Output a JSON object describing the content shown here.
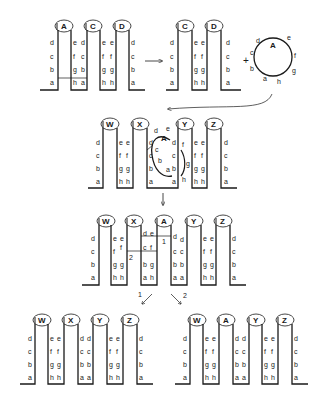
{
  "figure": {
    "colors": {
      "ink": "#1a1a1a",
      "background": "#ffffff"
    },
    "row1_left": {
      "hairpins": [
        {
          "name": "A",
          "left": [
            "d",
            "c",
            "b",
            "a"
          ],
          "right": [
            "e",
            "f",
            "g",
            "h"
          ]
        },
        {
          "name": "C",
          "left": [
            "d",
            "c",
            "b",
            "a"
          ],
          "right": [
            "e",
            "f",
            "g",
            "h"
          ]
        },
        {
          "name": "D",
          "left": [
            "d",
            "c",
            "b",
            "a"
          ],
          "right": [
            "d",
            "c",
            "b",
            "a"
          ]
        }
      ]
    },
    "row1_right": {
      "hairpins": [
        {
          "name": "C",
          "left": [
            "d",
            "c",
            "b",
            "a"
          ],
          "right": [
            "e",
            "f",
            "g",
            "h"
          ]
        },
        {
          "name": "D",
          "left": [
            "e",
            "f",
            "g",
            "h"
          ],
          "right": [
            "d",
            "c",
            "b",
            "a"
          ]
        }
      ],
      "plus": "+",
      "circle": {
        "name": "A",
        "letters": [
          "d",
          "e",
          "f",
          "g",
          "h",
          "a",
          "b",
          "c"
        ]
      }
    },
    "row2": {
      "hairpins": [
        {
          "name": "W",
          "left": [
            "d",
            "c",
            "b",
            "a"
          ],
          "right": [
            "e",
            "f",
            "g",
            "h"
          ]
        },
        {
          "name": "X",
          "left": [
            "e",
            "f",
            "g",
            "h"
          ],
          "right": [
            "d",
            "c",
            "b",
            "a"
          ]
        },
        {
          "name": "Y",
          "left": [
            "d",
            "c",
            "b",
            "a"
          ],
          "right": [
            "e",
            "f",
            "g",
            "h"
          ]
        },
        {
          "name": "Z",
          "left": [
            "e",
            "f",
            "g",
            "h"
          ],
          "right": [
            "d",
            "c",
            "b",
            "a"
          ]
        }
      ],
      "circle": {
        "name": "A",
        "letters": [
          "d",
          "e",
          "c",
          "b",
          "a",
          "f",
          "g",
          "h"
        ]
      }
    },
    "row3": {
      "hairpins": [
        {
          "name": "W"
        },
        {
          "name": "X"
        },
        {
          "name": "A"
        },
        {
          "name": "Y"
        },
        {
          "name": "Z"
        }
      ],
      "crossover_labels": [
        "1",
        "2"
      ]
    },
    "row4": {
      "arrow_labels": [
        "1",
        "2"
      ],
      "product1": {
        "hairpins": [
          "W",
          "X",
          "Y",
          "Z"
        ]
      },
      "product2": {
        "hairpins": [
          "W",
          "A",
          "Y",
          "Z"
        ]
      }
    }
  }
}
